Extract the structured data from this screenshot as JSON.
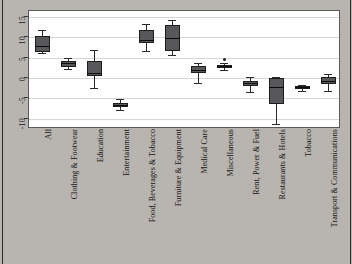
{
  "chart_data": {
    "type": "box",
    "title": "",
    "xlabel": "",
    "ylabel": "",
    "ylim": [
      -12.5,
      16.5
    ],
    "grid": true,
    "legend": null,
    "yticks": [
      15,
      10,
      5,
      0,
      -5,
      -10
    ],
    "ytick_labels": [
      "15",
      "10",
      "5",
      "0",
      "-5",
      "-10"
    ],
    "categories": [
      "All",
      "Clothing & Footwear",
      "Education",
      "Entertainment",
      "Food, Beverages & Tobacco",
      "Furniture & Equipment",
      "Medical Care",
      "Miscellaneous",
      "Rent, Power & Fuel",
      "Restaurants & Hotels",
      "Tobacco",
      "Transport & Communications"
    ],
    "boxes": [
      {
        "category": "All",
        "whisker_low": 6.2,
        "q1": 6.5,
        "median": 8.0,
        "q3": 10.3,
        "whisker_high": 11.8,
        "outliers": []
      },
      {
        "category": "Clothing & Footwear",
        "whisker_low": 2.3,
        "q1": 2.8,
        "median": 3.6,
        "q3": 4.2,
        "whisker_high": 5.0,
        "outliers": []
      },
      {
        "category": "Education",
        "whisker_low": -2.5,
        "q1": 0.6,
        "median": 1.3,
        "q3": 4.3,
        "whisker_high": 7.0,
        "outliers": []
      },
      {
        "category": "Entertainment",
        "whisker_low": -7.9,
        "q1": -7.2,
        "median": -6.6,
        "q3": -6.0,
        "whisker_high": -5.2,
        "outliers": []
      },
      {
        "category": "Food, Beverages & Tobacco",
        "whisker_low": 6.7,
        "q1": 8.6,
        "median": 9.4,
        "q3": 11.8,
        "whisker_high": 13.3,
        "outliers": []
      },
      {
        "category": "Furniture & Equipment",
        "whisker_low": 5.8,
        "q1": 6.6,
        "median": 9.9,
        "q3": 13.0,
        "whisker_high": 14.2,
        "outliers": []
      },
      {
        "category": "Medical Care",
        "whisker_low": -1.1,
        "q1": 1.3,
        "median": 2.0,
        "q3": 2.9,
        "whisker_high": 3.8,
        "outliers": []
      },
      {
        "category": "Miscellaneous",
        "whisker_low": 1.9,
        "q1": 2.4,
        "median": 2.9,
        "q3": 3.2,
        "whisker_high": 3.6,
        "outliers": [
          4.6
        ]
      },
      {
        "category": "Rent, Power & Fuel",
        "whisker_low": -3.3,
        "q1": -2.0,
        "median": -1.2,
        "q3": -0.7,
        "whisker_high": 0.3,
        "outliers": []
      },
      {
        "category": "Restaurants & Hotels",
        "whisker_low": -11.2,
        "q1": -6.4,
        "median": -2.1,
        "q3": 0.1,
        "whisker_high": 0.3,
        "outliers": []
      },
      {
        "category": "Tobacco",
        "whisker_low": -3.1,
        "q1": -2.7,
        "median": -2.3,
        "q3": -1.9,
        "whisker_high": -1.7,
        "outliers": []
      },
      {
        "category": "Transport & Communications",
        "whisker_low": -3.1,
        "q1": -1.4,
        "median": -0.6,
        "q3": 0.2,
        "whisker_high": 1.0,
        "outliers": []
      }
    ],
    "colors": {
      "box_fill": "#58585a",
      "box_edge": "#1d1d1d",
      "median": "#0d0d0d",
      "whisker": "#2a2a2a",
      "grid": "#d6d6d6",
      "plot_bg": "#ffffff",
      "figure_bg": "#b8b5b0"
    }
  }
}
